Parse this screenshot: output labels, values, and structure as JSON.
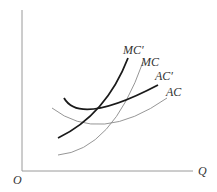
{
  "diagram": {
    "axes": {
      "origin_label": "O",
      "x_label": "Q"
    },
    "curves": [
      {
        "id": "mc_prime",
        "label": "MC′",
        "weight": "thick",
        "color": "#1a1a1a"
      },
      {
        "id": "mc",
        "label": "MC",
        "weight": "thin",
        "color": "#8a8a8a"
      },
      {
        "id": "ac_prime",
        "label": "AC′",
        "weight": "thick",
        "color": "#1a1a1a"
      },
      {
        "id": "ac",
        "label": "AC",
        "weight": "thin",
        "color": "#8a8a8a"
      }
    ]
  }
}
